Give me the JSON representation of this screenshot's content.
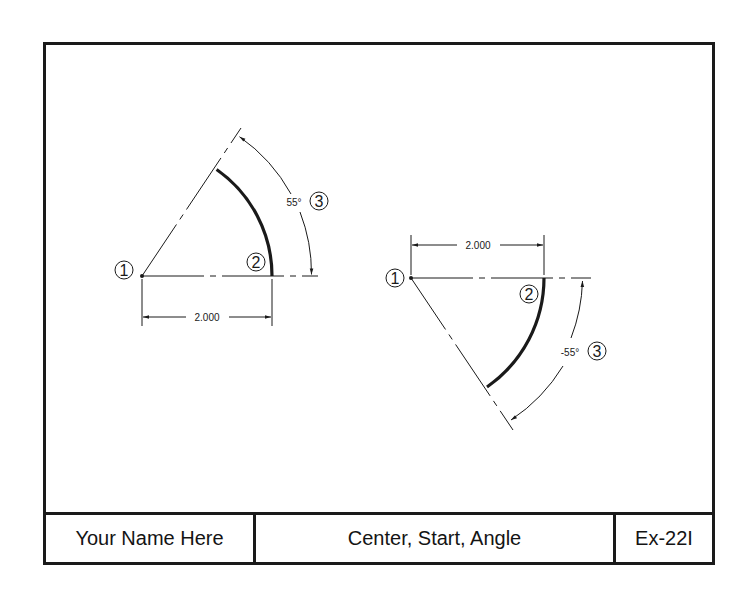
{
  "title_block": {
    "name": "Your Name Here",
    "title": "Center, Start, Angle",
    "exercise": "Ex-22I"
  },
  "colors": {
    "line": "#1a1a1a",
    "background": "#ffffff"
  },
  "figures": [
    {
      "id": "positive-angle",
      "center_label": "1",
      "start_label": "2",
      "angle_label": "3",
      "radius_dimension": "2.000",
      "angle_dimension": "55°"
    },
    {
      "id": "negative-angle",
      "center_label": "1",
      "start_label": "2",
      "angle_label": "3",
      "radius_dimension": "2.000",
      "angle_dimension": "-55°"
    }
  ]
}
